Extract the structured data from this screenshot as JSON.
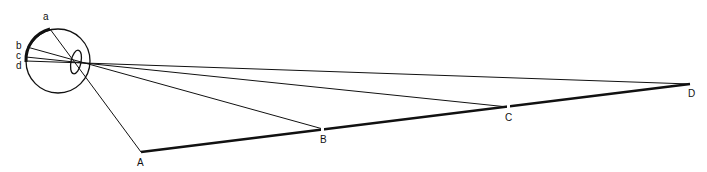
{
  "diagram": {
    "type": "eye-projection",
    "colors": {
      "stroke": "#111111",
      "background": "#ffffff"
    },
    "eye": {
      "retina_labels": [
        "a",
        "b",
        "c",
        "d"
      ]
    },
    "object_points": {
      "labels": [
        "A",
        "B",
        "C",
        "D"
      ]
    }
  }
}
